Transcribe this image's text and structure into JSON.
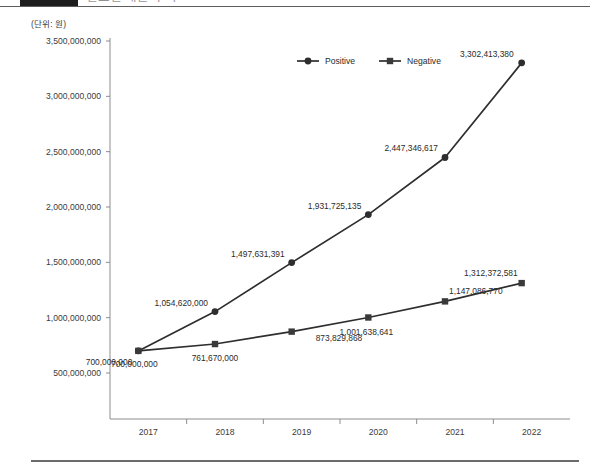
{
  "header": {
    "badge_label": "",
    "title": "연도별 매출 추이",
    "unit_label": "(단위: 원)"
  },
  "chart_data": {
    "type": "line",
    "title": "",
    "xlabel": "",
    "ylabel": "",
    "unit": "(단위: 원)",
    "categories": [
      "2017",
      "2018",
      "2019",
      "2020",
      "2021",
      "2022"
    ],
    "ylim": [
      0,
      3500000000
    ],
    "ytick_values": [
      500000000,
      1000000000,
      1500000000,
      2000000000,
      2500000000,
      3000000000,
      3500000000
    ],
    "ytick_labels": [
      "500,000,000",
      "1,000,000,000",
      "1,500,000,000",
      "2,000,000,000",
      "2,500,000,000",
      "3,000,000,000",
      "3,500,000,000"
    ],
    "grid": false,
    "legend_position": "top-center",
    "series": [
      {
        "name": "Positive",
        "marker": "circle",
        "color": "#2e2e2e",
        "values": [
          700000000,
          1054620000,
          1497631391,
          1931725135,
          2447346617,
          3302413380
        ],
        "data_labels": [
          "700,000,000",
          "1,054,620,000",
          "1,497,631,391",
          "1,931,725,135",
          "2,447,346,617",
          "3,302,413,380"
        ]
      },
      {
        "name": "Negative",
        "marker": "square",
        "color": "#3a3a3a",
        "values": [
          700000000,
          761670000,
          873829868,
          1001638641,
          1147086770,
          1312372581
        ],
        "data_labels": [
          "700,000,000",
          "761,670,000",
          "873,829,868",
          "1,001,638,641",
          "1,147,086,770",
          "1,312,372,581"
        ]
      }
    ]
  }
}
